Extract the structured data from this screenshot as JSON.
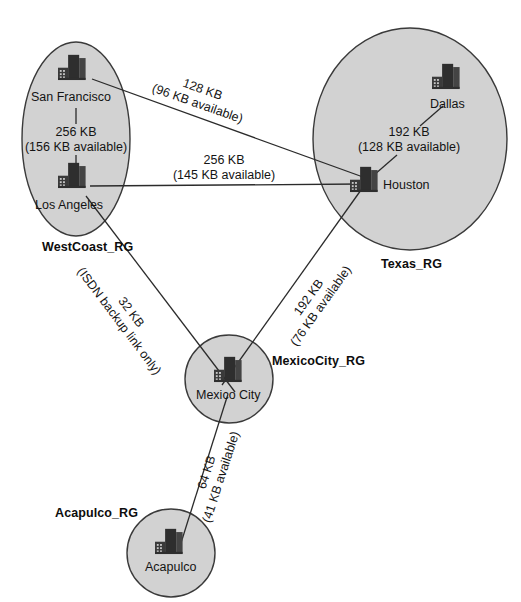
{
  "diagram": {
    "colors": {
      "region_fill": "#d2d2d2",
      "region_stroke": "#3a3a3a",
      "link_stroke": "#2b2b2b",
      "text": "#141414",
      "background": "#ffffff"
    }
  },
  "regions": [
    {
      "id": "westcoast",
      "label": "WestCoast_RG",
      "shape": "ellipse"
    },
    {
      "id": "texas",
      "label": "Texas_RG",
      "shape": "ellipse"
    },
    {
      "id": "mexicocity",
      "label": "MexicoCity_RG",
      "shape": "circle"
    },
    {
      "id": "acapulco",
      "label": "Acapulco_RG",
      "shape": "circle"
    }
  ],
  "sites": [
    {
      "id": "san-francisco",
      "label": "San Francisco",
      "region": "westcoast",
      "icon": "buildings-icon"
    },
    {
      "id": "los-angeles",
      "label": "Los Angeles",
      "region": "westcoast",
      "icon": "buildings-icon"
    },
    {
      "id": "dallas",
      "label": "Dallas",
      "region": "texas",
      "icon": "buildings-icon"
    },
    {
      "id": "houston",
      "label": "Houston",
      "region": "texas",
      "icon": "buildings-icon"
    },
    {
      "id": "mexico-city",
      "label": "Mexico City",
      "region": "mexicocity",
      "icon": "buildings-icon"
    },
    {
      "id": "acapulco",
      "label": "Acapulco",
      "region": "acapulco",
      "icon": "buildings-icon"
    }
  ],
  "links": [
    {
      "id": "sf-la",
      "from": "san-francisco",
      "to": "los-angeles",
      "speed": "256 KB",
      "available": "(156 KB available)"
    },
    {
      "id": "dallas-houston",
      "from": "dallas",
      "to": "houston",
      "speed": "192 KB",
      "available": "(128 KB available)"
    },
    {
      "id": "sf-houston",
      "from": "san-francisco",
      "to": "houston",
      "speed": "128 KB",
      "available": "(96 KB available)"
    },
    {
      "id": "la-houston",
      "from": "los-angeles",
      "to": "houston",
      "speed": "256 KB",
      "available": "(145 KB available)"
    },
    {
      "id": "la-mexicocity",
      "from": "los-angeles",
      "to": "mexico-city",
      "speed": "32 KB",
      "available": "(ISDN backup link only)"
    },
    {
      "id": "houston-mexicocity",
      "from": "houston",
      "to": "mexico-city",
      "speed": "192 KB",
      "available": "(76 KB available)"
    },
    {
      "id": "mexicocity-acapulco",
      "from": "mexico-city",
      "to": "acapulco",
      "speed": "64 KB",
      "available": "(41 KB available)"
    }
  ]
}
